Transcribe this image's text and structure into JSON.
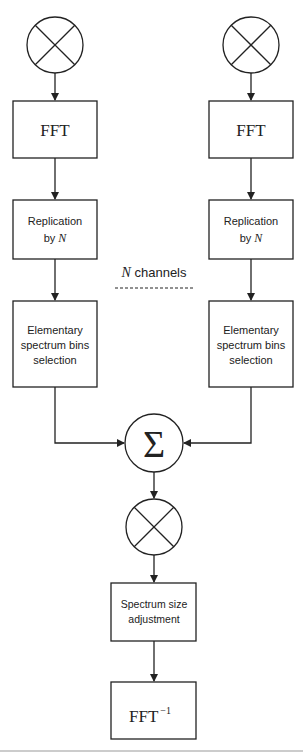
{
  "diagram": {
    "left_channel": {
      "mixer_icon": "multiply-circle",
      "fft_label": "FFT",
      "replication_line1": "Replication",
      "replication_line2_prefix": "by ",
      "replication_line2_var": "N",
      "selection_line1": "Elementary",
      "selection_line2": "spectrum bins",
      "selection_line3": "selection"
    },
    "right_channel": {
      "mixer_icon": "multiply-circle",
      "fft_label": "FFT",
      "replication_line1": "Replication",
      "replication_line2_prefix": "by ",
      "replication_line2_var": "N",
      "selection_line1": "Elementary",
      "selection_line2": "spectrum bins",
      "selection_line3": "selection"
    },
    "channels_label_var": "N",
    "channels_label_text": " channels",
    "sum_symbol": "Σ",
    "output": {
      "mixer_icon": "multiply-circle",
      "size_adjust_line1": "Spectrum size",
      "size_adjust_line2": "adjustment",
      "ifft_label": "FFT",
      "ifft_superscript": "−1"
    }
  }
}
